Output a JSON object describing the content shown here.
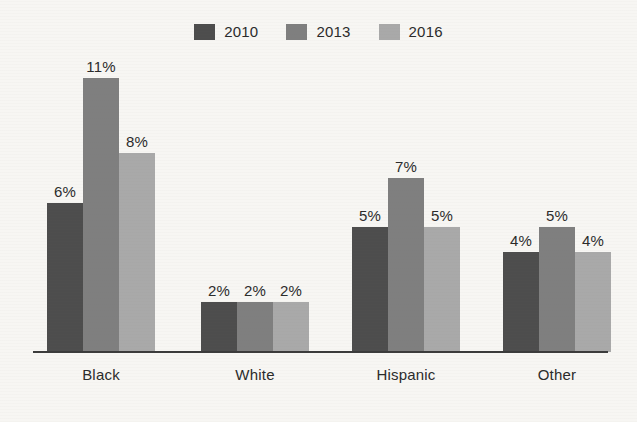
{
  "chart_data": {
    "type": "bar",
    "title": "",
    "subtitle": "",
    "xlabel": "",
    "ylabel": "",
    "categories": [
      "Black",
      "White",
      "Hispanic",
      "Other"
    ],
    "series": [
      {
        "name": "2010",
        "color": "#4d4d4d",
        "values": [
          6,
          2,
          5,
          4
        ],
        "labels": [
          "6%",
          "2%",
          "5%",
          "4%"
        ]
      },
      {
        "name": "2013",
        "color": "#7f7f7f",
        "values": [
          11,
          2,
          7,
          5
        ],
        "labels": [
          "11%",
          "2%",
          "7%",
          "5%"
        ]
      },
      {
        "name": "2016",
        "color": "#a9a9a9",
        "values": [
          8,
          2,
          5,
          4
        ],
        "labels": [
          "8%",
          "2%",
          "5%",
          "4%"
        ]
      }
    ],
    "value_suffix": "%",
    "ylim": [
      0,
      11
    ],
    "grid": false,
    "legend_position": "top-center",
    "axis_color": "#3b3b3b",
    "background_color": "#f7f6f3",
    "text_color": "#2b2b2b"
  },
  "legend": {
    "items": [
      {
        "label": "2010",
        "color": "#4d4d4d"
      },
      {
        "label": "2013",
        "color": "#7f7f7f"
      },
      {
        "label": "2016",
        "color": "#a9a9a9"
      }
    ]
  },
  "groups": [
    {
      "category": "Black",
      "bars": [
        {
          "series": "2010",
          "label": "6%",
          "value": 6
        },
        {
          "series": "2013",
          "label": "11%",
          "value": 11
        },
        {
          "series": "2016",
          "label": "8%",
          "value": 8
        }
      ]
    },
    {
      "category": "White",
      "bars": [
        {
          "series": "2010",
          "label": "2%",
          "value": 2
        },
        {
          "series": "2013",
          "label": "2%",
          "value": 2
        },
        {
          "series": "2016",
          "label": "2%",
          "value": 2
        }
      ]
    },
    {
      "category": "Hispanic",
      "bars": [
        {
          "series": "2010",
          "label": "5%",
          "value": 5
        },
        {
          "series": "2013",
          "label": "7%",
          "value": 7
        },
        {
          "series": "2016",
          "label": "5%",
          "value": 5
        }
      ]
    },
    {
      "category": "Other",
      "bars": [
        {
          "series": "2010",
          "label": "4%",
          "value": 4
        },
        {
          "series": "2013",
          "label": "5%",
          "value": 5
        },
        {
          "series": "2016",
          "label": "4%",
          "value": 4
        }
      ]
    }
  ]
}
